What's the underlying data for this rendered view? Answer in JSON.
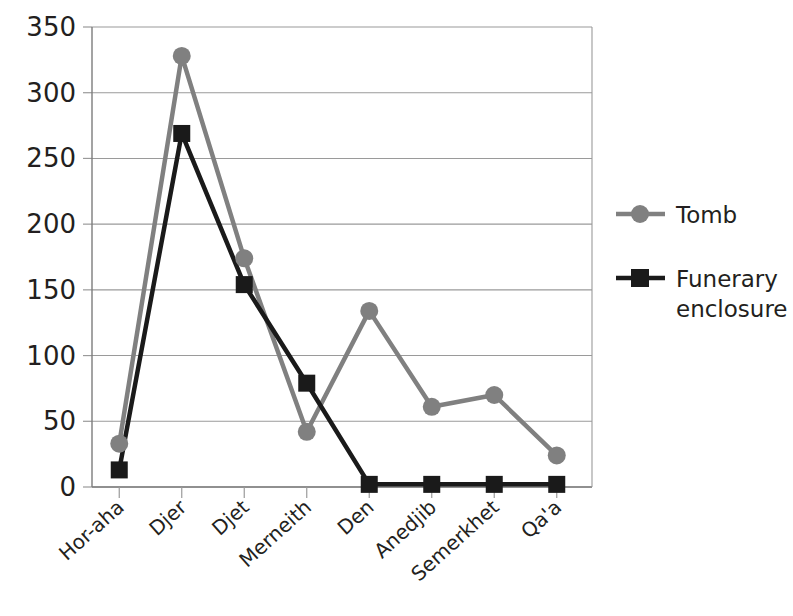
{
  "chart_data": {
    "type": "line",
    "title": "",
    "subtitle": "",
    "xlabel": "",
    "ylabel": "",
    "categories": [
      "Hor-aha",
      "Djer",
      "Djet",
      "Merneith",
      "Den",
      "Anedjib",
      "Semerkhet",
      "Qa'a"
    ],
    "series": [
      {
        "name": "Tomb",
        "color": "#808080",
        "marker": "circle",
        "values": [
          33,
          328,
          174,
          42,
          134,
          61,
          70,
          24
        ]
      },
      {
        "name": "Funerary enclosure",
        "color": "#1a1a1a",
        "marker": "square",
        "values": [
          13,
          269,
          154,
          79,
          2,
          2,
          2,
          2
        ]
      }
    ],
    "ylim": [
      0,
      350
    ],
    "ytick_values": [
      0,
      50,
      100,
      150,
      200,
      250,
      300,
      350
    ],
    "ytick_labels": [
      "0",
      "50",
      "100",
      "150",
      "200",
      "250",
      "300",
      "350"
    ],
    "grid": "horizontal",
    "legend_position": "right"
  },
  "legend": {
    "entries": [
      {
        "label": "Tomb",
        "color": "#808080",
        "marker": "circle-marker"
      },
      {
        "label": "Funerary",
        "label2": "enclosure",
        "color": "#1a1a1a",
        "marker": "square-marker"
      }
    ]
  },
  "colors": {
    "series_tomb": "#808080",
    "series_enclosure": "#1a1a1a",
    "gridline": "#9a9a9a",
    "text": "#231f20",
    "background": "#ffffff"
  }
}
